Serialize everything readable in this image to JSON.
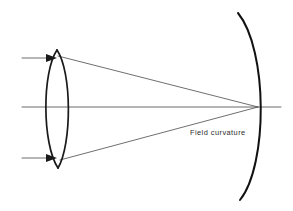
{
  "figure": {
    "title_text": "Field curvature",
    "caption": {
      "text": "Field curvature",
      "x": 190,
      "y": 135
    },
    "canvas": {
      "width": 293,
      "height": 211,
      "background": "#ffffff"
    },
    "colors": {
      "ink": "#1a1a1a",
      "ray": "#4a4a4a",
      "axis": "#5a5a5a",
      "field_surface": "#111111",
      "background": "#ffffff"
    },
    "elements": {
      "optical_axis": {
        "name": "optical-axis",
        "path": "M 22 107 L 281 107"
      },
      "lens": {
        "name": "biconvex-lens",
        "type": "biconvex",
        "apex_top": {
          "x": 57,
          "y": 50
        },
        "apex_bottom": {
          "x": 58,
          "y": 168
        },
        "edge_left_x": 44,
        "edge_right_x": 71,
        "mid_y": 107,
        "front_surface_path": "M 57 50 C 42 72 42 144 58 168",
        "back_surface_path": "M 57 50 C 72 72 72 144 58 168"
      },
      "incoming_rays": [
        {
          "name": "incoming-ray-upper",
          "path": "M 22 58 L 54 58",
          "arrow_tip": {
            "x": 57,
            "y": 58
          },
          "arrow_points": "57,58 46,54 46,62"
        },
        {
          "name": "incoming-ray-lower",
          "path": "M 22 158 L 54 158",
          "arrow_tip": {
            "x": 57,
            "y": 158
          },
          "arrow_points": "57,158 46,154 46,162"
        }
      ],
      "refracted_rays": [
        {
          "name": "refracted-ray-upper",
          "path": "M 58 56 L 258 107"
        },
        {
          "name": "refracted-ray-lower",
          "path": "M 60 160 L 258 107"
        }
      ],
      "field_surface": {
        "name": "curved-focal-surface",
        "path": "M 238 13 C 268 50 268 165 240 200",
        "vertex": {
          "x": 258,
          "y": 107
        }
      },
      "focus_point": {
        "name": "focal-point",
        "x": 258,
        "y": 107
      }
    }
  }
}
